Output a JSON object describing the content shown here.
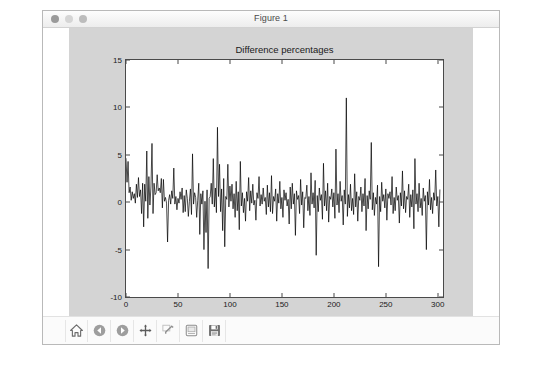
{
  "window": {
    "title": "Figure 1",
    "controls": [
      {
        "name": "close-button",
        "color": "#9a9a9a"
      },
      {
        "name": "minimize-button",
        "color": "#d5d5d5"
      },
      {
        "name": "zoom-button",
        "color": "#bcbcbc"
      }
    ]
  },
  "toolbar": {
    "buttons": [
      {
        "icon": "home-icon",
        "label": "Reset original view"
      },
      {
        "icon": "back-arrow-icon",
        "label": "Back to previous view"
      },
      {
        "icon": "forward-arrow-icon",
        "label": "Forward to next view"
      },
      {
        "icon": "move-cross-icon",
        "label": "Pan axes with left mouse, zoom with right"
      },
      {
        "icon": "zoom-rect-icon",
        "label": "Zoom to rectangle"
      },
      {
        "icon": "configure-subplots-icon",
        "label": "Configure subplots"
      },
      {
        "icon": "save-floppy-icon",
        "label": "Save the figure"
      }
    ]
  },
  "chart_data": {
    "type": "line",
    "title": "Difference percentages",
    "xlabel": "",
    "ylabel": "",
    "xlim": [
      0,
      305
    ],
    "ylim": [
      -10,
      15
    ],
    "xticks": [
      0,
      50,
      100,
      150,
      200,
      250,
      300
    ],
    "xticklabels": [
      "0",
      "50",
      "100",
      "150",
      "200",
      "250",
      "300"
    ],
    "yticks": [
      -10,
      -5,
      0,
      5,
      10,
      15
    ],
    "yticklabels": [
      "-10",
      "-5",
      "0",
      "5",
      "10",
      "15"
    ],
    "grid": false,
    "legend": null,
    "line_color": "#000000",
    "line_width": 0.7,
    "background": "#ffffff",
    "figure_facecolor": "#d4d4d4",
    "series": [
      {
        "name": "difference percentage",
        "x_start": 0,
        "x_step": 1,
        "values": [
          4.6,
          2.1,
          4.3,
          1.0,
          1.6,
          0.2,
          1.1,
          0.4,
          0.9,
          -0.1,
          1.9,
          0.5,
          2.6,
          0.6,
          1.3,
          -1.2,
          2.0,
          -2.6,
          1.9,
          0.1,
          5.4,
          -1.7,
          2.7,
          -0.3,
          1.6,
          6.2,
          -1.2,
          2.0,
          0.8,
          1.0,
          2.9,
          1.2,
          1.5,
          1.0,
          2.5,
          -0.6,
          2.4,
          0.1,
          0.5,
          -0.1,
          -4.2,
          0.2,
          0.8,
          -0.2,
          1.2,
          0.4,
          3.6,
          -0.2,
          0.6,
          -0.8,
          0.4,
          -0.1,
          1.1,
          0.3,
          1.5,
          -1.1,
          0.7,
          -1.0,
          1.3,
          0.4,
          -1.5,
          0.1,
          1.4,
          -1.3,
          5.1,
          -0.2,
          1.0,
          0.5,
          -1.6,
          0.2,
          2.0,
          -3.4,
          0.9,
          -0.2,
          1.2,
          -5.0,
          0.1,
          -3.2,
          1.3,
          -7.0,
          0.4,
          0.6,
          2.0,
          -0.2,
          4.6,
          -0.5,
          1.5,
          -1.1,
          7.9,
          0.6,
          4.0,
          -1.0,
          1.4,
          -3.0,
          2.5,
          -4.7,
          0.6,
          0.3,
          4.0,
          -0.5,
          1.7,
          0.1,
          1.9,
          -0.7,
          0.9,
          -1.6,
          2.2,
          -0.9,
          1.1,
          -2.9,
          4.3,
          -0.4,
          1.0,
          -1.1,
          0.4,
          -2.0,
          1.1,
          0.1,
          2.6,
          -0.9,
          1.2,
          -0.1,
          1.9,
          -0.3,
          0.2,
          -1.9,
          1.0,
          0.4,
          2.7,
          -0.4,
          0.8,
          -0.2,
          1.5,
          0.1,
          0.5,
          -1.3,
          1.8,
          -0.5,
          1.0,
          -1.0,
          2.8,
          -1.2,
          0.6,
          0.1,
          1.4,
          -2.0,
          0.9,
          -0.1,
          2.2,
          -0.7,
          0.5,
          -1.6,
          1.3,
          0.2,
          1.0,
          -0.4,
          0.3,
          -2.3,
          1.6,
          -0.7,
          2.0,
          -0.2,
          0.9,
          -3.5,
          1.2,
          0.3,
          0.7,
          -1.2,
          2.4,
          -0.3,
          1.1,
          -2.7,
          0.5,
          0.4,
          1.8,
          -0.9,
          0.6,
          -1.4,
          3.1,
          -0.2,
          1.0,
          -0.6,
          2.3,
          -5.6,
          0.7,
          -1.0,
          1.5,
          0.2,
          0.8,
          -1.8,
          4.1,
          -0.4,
          1.2,
          -0.9,
          2.0,
          -2.1,
          0.6,
          0.3,
          1.4,
          -0.5,
          1.0,
          -1.7,
          5.6,
          -0.3,
          0.9,
          -1.1,
          2.2,
          0.1,
          0.7,
          -2.4,
          1.3,
          -0.2,
          11.0,
          -1.5,
          0.8,
          -0.6,
          1.9,
          -0.9,
          0.4,
          -1.3,
          3.0,
          -0.5,
          1.1,
          -2.0,
          0.6,
          0.2,
          1.6,
          -1.0,
          0.9,
          -0.4,
          2.5,
          -3.0,
          0.7,
          -0.7,
          1.2,
          0.3,
          6.3,
          -0.8,
          1.0,
          -1.4,
          0.5,
          -0.2,
          1.8,
          -6.8,
          0.6,
          -1.0,
          2.1,
          0.1,
          0.8,
          -0.6,
          1.4,
          -1.9,
          0.9,
          0.4,
          1.1,
          -0.3,
          2.7,
          -1.2,
          0.5,
          -0.9,
          1.6,
          0.2,
          0.7,
          -2.2,
          1.0,
          -0.4,
          3.3,
          -0.7,
          1.2,
          -1.1,
          0.6,
          0.3,
          1.9,
          -1.6,
          0.8,
          -0.5,
          1.3,
          -2.8,
          4.6,
          -0.2,
          0.9,
          -1.0,
          2.0,
          -0.6,
          0.4,
          -1.4,
          1.5,
          0.1,
          0.7,
          -5.0,
          1.1,
          -0.3,
          2.4,
          -0.8,
          0.5,
          -1.2,
          1.0,
          0.2,
          3.4,
          -0.4,
          0.6,
          -2.6,
          1.3
        ]
      }
    ]
  }
}
